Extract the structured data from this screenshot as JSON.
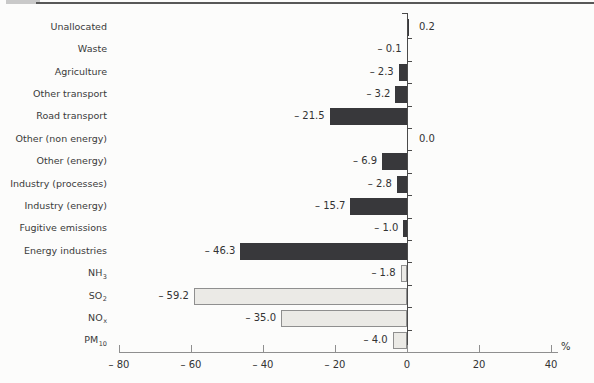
{
  "chart_data": {
    "type": "bar",
    "orientation": "horizontal",
    "title": "",
    "xlabel": "%",
    "xlim": [
      -80,
      40
    ],
    "xticks": [
      -80,
      -60,
      -40,
      -20,
      0,
      20,
      40
    ],
    "xtick_labels": [
      "– 80",
      "– 60",
      "– 40",
      "– 20",
      "0",
      "20",
      "40"
    ],
    "grid": false,
    "legend": null,
    "bars": [
      {
        "category": "Unallocated",
        "subscript": "",
        "value": 0.2,
        "value_label": "0.2",
        "style": "dark"
      },
      {
        "category": "Waste",
        "subscript": "",
        "value": -0.1,
        "value_label": "– 0.1",
        "style": "dark"
      },
      {
        "category": "Agriculture",
        "subscript": "",
        "value": -2.3,
        "value_label": "– 2.3",
        "style": "dark"
      },
      {
        "category": "Other transport",
        "subscript": "",
        "value": -3.2,
        "value_label": "– 3.2",
        "style": "dark"
      },
      {
        "category": "Road transport",
        "subscript": "",
        "value": -21.5,
        "value_label": "– 21.5",
        "style": "dark"
      },
      {
        "category": "Other (non energy)",
        "subscript": "",
        "value": 0.0,
        "value_label": "0.0",
        "style": "dark"
      },
      {
        "category": "Other (energy)",
        "subscript": "",
        "value": -6.9,
        "value_label": "– 6.9",
        "style": "dark"
      },
      {
        "category": "Industry (processes)",
        "subscript": "",
        "value": -2.8,
        "value_label": "– 2.8",
        "style": "dark"
      },
      {
        "category": "Industry (energy)",
        "subscript": "",
        "value": -15.7,
        "value_label": "– 15.7",
        "style": "dark"
      },
      {
        "category": "Fugitive emissions",
        "subscript": "",
        "value": -1.0,
        "value_label": "– 1.0",
        "style": "dark"
      },
      {
        "category": "Energy industries",
        "subscript": "",
        "value": -46.3,
        "value_label": "– 46.3",
        "style": "dark"
      },
      {
        "category": "NH",
        "subscript": "3",
        "value": -1.8,
        "value_label": "– 1.8",
        "style": "light"
      },
      {
        "category": "SO",
        "subscript": "2",
        "value": -59.2,
        "value_label": "– 59.2",
        "style": "light"
      },
      {
        "category": "NO",
        "subscript": "x",
        "value": -35.0,
        "value_label": "– 35.0",
        "style": "light"
      },
      {
        "category": "PM",
        "subscript": "10",
        "value": -4.0,
        "value_label": "– 4.0",
        "style": "light"
      }
    ],
    "colors": {
      "dark_bar": "#38383b",
      "light_bar_fill": "#ebeae6",
      "light_bar_border": "#8f8f8f",
      "zero_axis": "#4a4a4a",
      "x_axis": "#8f8f8f",
      "text": "#333333",
      "background": "#fcfcfb"
    }
  }
}
